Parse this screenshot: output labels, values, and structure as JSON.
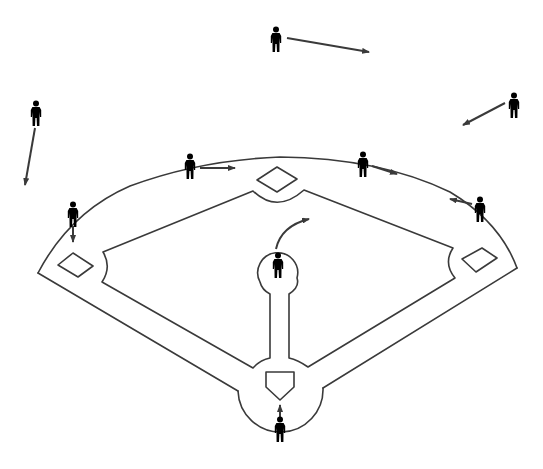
{
  "diagram": {
    "stroke_color": "#3a3a3a",
    "player_color": "#2b2b2b",
    "background": "#ffffff",
    "cutoff_caption": ""
  },
  "field": {
    "outer_arc": "M38,273 Q70,212 130,186 Q200,160 280,157 Q380,158 450,192 Q500,222 517,268",
    "outer_left_line": "M38,273 L238,391",
    "outer_right_line": "M517,268 L323,388",
    "home_circle": "M238,391 A42,42 0 1 0 323,388",
    "infield_grass": "M253,191 Q277,214 304,190 L453,248 Q443,263 455,278 L308,367 Q298,360 289,358 L289,294 Q300,287 297,278 A20,20 0 1 0 260,282 Q262,290 270,294 L270,358 Q260,360 253,368 L102,282 Q112,267 103,252 Z",
    "bases": {
      "second": "257,180 277,167 297,179 277,192",
      "third": "58,265 73,253 93,266 78,277",
      "first": "462,259 482,248 497,258 476,272"
    },
    "home_plate": "266,372 294,372 294,387 280,400 266,387"
  },
  "players": [
    {
      "name": "center-fielder",
      "x": 276,
      "y": 38
    },
    {
      "name": "left-fielder",
      "x": 36,
      "y": 112
    },
    {
      "name": "right-fielder",
      "x": 514,
      "y": 104
    },
    {
      "name": "second-baseman",
      "x": 190,
      "y": 165
    },
    {
      "name": "shortstop-side-fielder",
      "x": 363,
      "y": 163
    },
    {
      "name": "third-baseman",
      "x": 73,
      "y": 213
    },
    {
      "name": "first-baseman",
      "x": 480,
      "y": 208
    },
    {
      "name": "pitcher",
      "x": 278,
      "y": 264
    },
    {
      "name": "batter",
      "x": 280,
      "y": 428
    }
  ],
  "movement_arrows": [
    {
      "name": "center-fielder-arrow",
      "d": "M287,38 L369,52"
    },
    {
      "name": "left-fielder-arrow",
      "d": "M35,128 L25,185"
    },
    {
      "name": "right-fielder-arrow",
      "d": "M505,103 L463,125"
    },
    {
      "name": "second-baseman-arrow",
      "d": "M200,168 L235,168"
    },
    {
      "name": "fielder-arrow-right-center",
      "d": "M372,166 L397,174"
    },
    {
      "name": "third-baseman-arrow",
      "d": "M73,226 L73,242"
    },
    {
      "name": "first-baseman-arrow",
      "d": "M472,204 L450,199"
    },
    {
      "name": "pitcher-arrow",
      "d": "M276,249 Q281,226 309,219"
    },
    {
      "name": "batter-arrow",
      "d": "M280,417 L280,405"
    }
  ]
}
